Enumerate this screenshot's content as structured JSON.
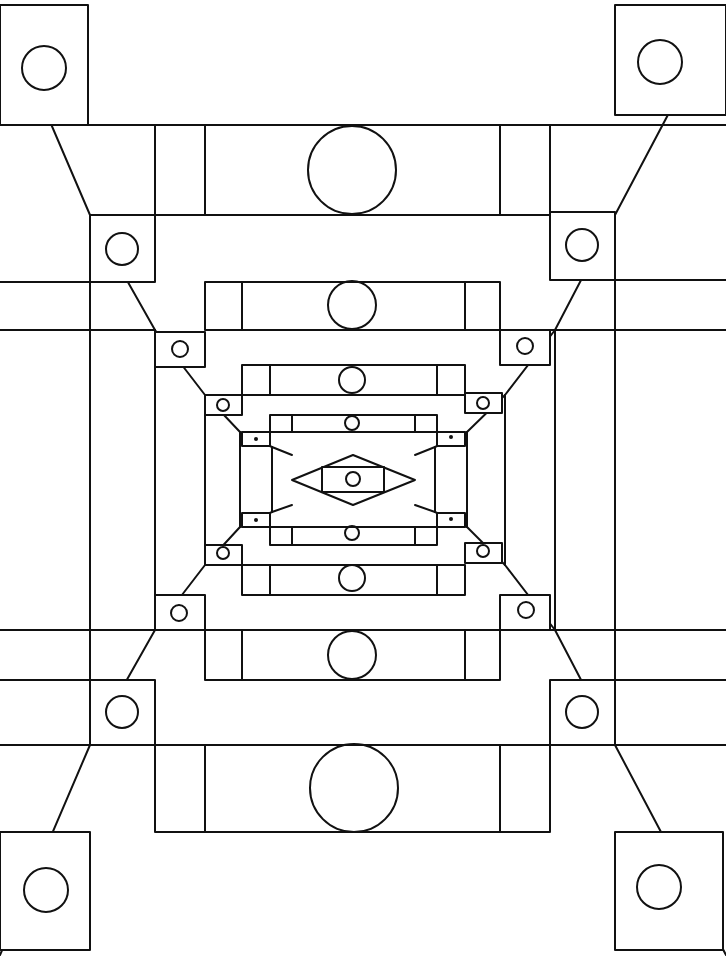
{
  "figure": {
    "colors": {
      "ink": "#111111",
      "paper": "#ffffff"
    },
    "frames": [
      {
        "x1": 0,
        "y1": 5,
        "x2": 726,
        "y2": 955,
        "note": "outer corner blocks"
      },
      {
        "x1": 90,
        "y1": 215,
        "x2": 615,
        "y2": 745
      },
      {
        "x1": 155,
        "y1": 330,
        "x2": 555,
        "y2": 630
      },
      {
        "x1": 205,
        "y1": 395,
        "x2": 505,
        "y2": 565
      },
      {
        "x1": 240,
        "y1": 432,
        "x2": 467,
        "y2": 527
      },
      {
        "x1": 272,
        "y1": 447,
        "x2": 435,
        "y2": 512
      },
      {
        "x1": 292,
        "y1": 455,
        "x2": 415,
        "y2": 505
      }
    ],
    "beams": [
      {
        "y1": 125,
        "y2": 215,
        "x1": 155,
        "x2": 550,
        "inner_x1": 205,
        "inner_x2": 500,
        "circle": {
          "cx": 352,
          "cy": 170,
          "r": 44
        }
      },
      {
        "y1": 282,
        "y2": 330,
        "x1": 205,
        "x2": 500,
        "inner_x1": 242,
        "inner_x2": 465,
        "circle": {
          "cx": 352,
          "cy": 305,
          "r": 24
        }
      },
      {
        "y1": 365,
        "y2": 395,
        "x1": 242,
        "x2": 465,
        "inner_x1": 270,
        "inner_x2": 437,
        "circle": {
          "cx": 352,
          "cy": 380,
          "r": 13
        }
      },
      {
        "y1": 415,
        "y2": 432,
        "x1": 270,
        "x2": 437,
        "inner_x1": 292,
        "inner_x2": 415,
        "circle": {
          "cx": 352,
          "cy": 423,
          "r": 7
        }
      },
      {
        "y1": 527,
        "y2": 545,
        "x1": 270,
        "x2": 437,
        "inner_x1": 292,
        "inner_x2": 415,
        "circle": {
          "cx": 352,
          "cy": 533,
          "r": 7
        }
      },
      {
        "y1": 565,
        "y2": 595,
        "x1": 242,
        "x2": 465,
        "inner_x1": 270,
        "inner_x2": 437,
        "circle": {
          "cx": 352,
          "cy": 578,
          "r": 13
        }
      },
      {
        "y1": 630,
        "y2": 680,
        "x1": 205,
        "x2": 500,
        "inner_x1": 242,
        "inner_x2": 465,
        "circle": {
          "cx": 352,
          "cy": 655,
          "r": 24
        }
      },
      {
        "y1": 745,
        "y2": 832,
        "x1": 155,
        "x2": 550,
        "inner_x1": 205,
        "inner_x2": 500,
        "circle": {
          "cx": 354,
          "cy": 788,
          "r": 44
        }
      }
    ],
    "corner_blocks": [
      {
        "x": 0,
        "y": 5,
        "w": 88,
        "h": 120,
        "circle": {
          "cx": 44,
          "cy": 68,
          "r": 22
        }
      },
      {
        "x": 615,
        "y": 5,
        "w": 111,
        "h": 110,
        "circle": {
          "cx": 660,
          "cy": 62,
          "r": 22
        }
      },
      {
        "x": 90,
        "y": 215,
        "w": 65,
        "h": 67,
        "circle": {
          "cx": 122,
          "cy": 249,
          "r": 16
        }
      },
      {
        "x": 550,
        "y": 212,
        "w": 65,
        "h": 68,
        "circle": {
          "cx": 582,
          "cy": 245,
          "r": 16
        }
      },
      {
        "x": 155,
        "y": 332,
        "w": 50,
        "h": 35,
        "circle": {
          "cx": 180,
          "cy": 349,
          "r": 8
        }
      },
      {
        "x": 500,
        "y": 330,
        "w": 50,
        "h": 35,
        "circle": {
          "cx": 525,
          "cy": 346,
          "r": 8
        }
      },
      {
        "x": 205,
        "y": 395,
        "w": 37,
        "h": 20,
        "circle": {
          "cx": 223,
          "cy": 405,
          "r": 6
        }
      },
      {
        "x": 465,
        "y": 393,
        "w": 37,
        "h": 20,
        "circle": {
          "cx": 483,
          "cy": 403,
          "r": 6
        }
      },
      {
        "x": 242,
        "y": 432,
        "w": 28,
        "h": 14,
        "dot": {
          "cx": 256,
          "cy": 439
        }
      },
      {
        "x": 437,
        "y": 432,
        "w": 28,
        "h": 14,
        "dot": {
          "cx": 451,
          "cy": 437
        }
      },
      {
        "x": 242,
        "y": 513,
        "w": 28,
        "h": 14,
        "dot": {
          "cx": 256,
          "cy": 520
        }
      },
      {
        "x": 437,
        "y": 513,
        "w": 28,
        "h": 14,
        "dot": {
          "cx": 451,
          "cy": 519
        }
      },
      {
        "x": 205,
        "y": 545,
        "w": 37,
        "h": 20,
        "circle": {
          "cx": 223,
          "cy": 553,
          "r": 6
        }
      },
      {
        "x": 465,
        "y": 543,
        "w": 37,
        "h": 20,
        "circle": {
          "cx": 483,
          "cy": 551,
          "r": 6
        }
      },
      {
        "x": 155,
        "y": 595,
        "w": 50,
        "h": 35,
        "circle": {
          "cx": 179,
          "cy": 613,
          "r": 8
        }
      },
      {
        "x": 500,
        "y": 595,
        "w": 50,
        "h": 35,
        "circle": {
          "cx": 526,
          "cy": 610,
          "r": 8
        }
      },
      {
        "x": 90,
        "y": 680,
        "w": 65,
        "h": 65,
        "circle": {
          "cx": 122,
          "cy": 712,
          "r": 16
        }
      },
      {
        "x": 550,
        "y": 680,
        "w": 65,
        "h": 65,
        "circle": {
          "cx": 582,
          "cy": 712,
          "r": 16
        }
      },
      {
        "x": 0,
        "y": 832,
        "w": 90,
        "h": 118,
        "circle": {
          "cx": 46,
          "cy": 890,
          "r": 22
        }
      },
      {
        "x": 615,
        "y": 832,
        "w": 108,
        "h": 118,
        "circle": {
          "cx": 659,
          "cy": 887,
          "r": 22
        }
      }
    ],
    "center": {
      "rect": {
        "x": 322,
        "y": 467,
        "w": 62,
        "h": 25
      },
      "circle": {
        "cx": 353,
        "cy": 479,
        "r": 7
      },
      "diamond": [
        [
          292,
          480
        ],
        [
          353,
          455
        ],
        [
          415,
          480
        ],
        [
          353,
          505
        ]
      ]
    }
  }
}
